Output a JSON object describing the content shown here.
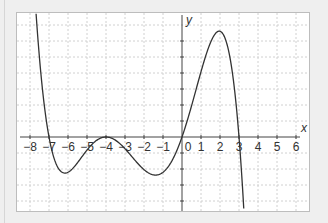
{
  "chart_data": {
    "type": "line",
    "title": "",
    "xlabel": "x",
    "ylabel": "y",
    "xlim": [
      -8.3,
      6.6
    ],
    "ylim": [
      -4.6,
      7.7
    ],
    "grid": true,
    "grid_style": "dashed",
    "x_ticks": [
      -8,
      -7,
      -6,
      -5,
      -4,
      -3,
      -2,
      -1,
      0,
      1,
      2,
      3,
      4,
      5,
      6
    ],
    "x_tick_labels": [
      "−8",
      "−7",
      "−6",
      "−5",
      "−4",
      "−3",
      "−2",
      "−1",
      "0",
      "1",
      "2",
      "3",
      "4",
      "5",
      "6"
    ],
    "y_ticks": [
      -4,
      -3,
      -2,
      -1,
      1,
      2,
      3,
      4,
      5,
      6
    ],
    "series": [
      {
        "name": "f(x)",
        "formula": "-0.0102 * x * (x+7) * (x+4)^2 * (x-3)",
        "x_range": [
          -7.68,
          3.25
        ],
        "key_points": [
          {
            "x": -7,
            "y": 0,
            "label": "root"
          },
          {
            "x": -6.1,
            "y": -2.2,
            "label": "local min"
          },
          {
            "x": -4,
            "y": 0,
            "label": "double root / local max"
          },
          {
            "x": -1.3,
            "y": -2.4,
            "label": "local min"
          },
          {
            "x": 0,
            "y": 0,
            "label": "root"
          },
          {
            "x": 2,
            "y": 6.6,
            "label": "local max"
          },
          {
            "x": 3,
            "y": 0,
            "label": "root"
          }
        ],
        "color": "#333333"
      }
    ]
  },
  "axes": {
    "x_label": "x",
    "y_label": "y",
    "origin_label": "0"
  },
  "colors": {
    "curve": "#333333",
    "axis": "#444444",
    "grid": "#d0d0d0",
    "background": "#efefef",
    "plot_bg": "#ffffff"
  }
}
